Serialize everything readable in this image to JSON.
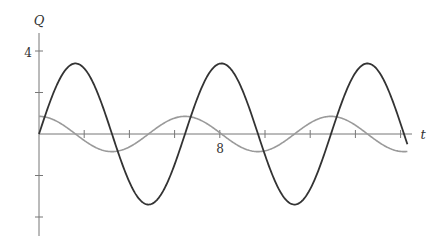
{
  "chart_data": {
    "type": "line",
    "title": "",
    "xlabel": "t",
    "ylabel": "Q",
    "x_ticks": [
      2,
      4,
      6,
      8,
      10,
      12,
      14,
      16
    ],
    "x_tick_labels": [
      {
        "value": 8,
        "label": "8"
      }
    ],
    "y_ticks": [
      -4,
      -2,
      2,
      4
    ],
    "y_tick_labels": [
      {
        "value": 4,
        "label": "4"
      }
    ],
    "xlim": [
      0,
      16.3
    ],
    "ylim": [
      -4.9,
      4.9
    ],
    "grid": false,
    "series": [
      {
        "name": "dark curve",
        "color": "#333333",
        "function": "3.4*sin(0.973*t)",
        "amplitude": 3.4,
        "period": 6.46
      },
      {
        "name": "gray curve",
        "color": "#999999",
        "function": "0.85*cos(0.973*t)",
        "amplitude": 0.85,
        "period": 6.46
      }
    ]
  },
  "labels": {
    "y_axis": "Q",
    "x_axis": "t",
    "y_tick_4": "4",
    "x_tick_8": "8"
  }
}
